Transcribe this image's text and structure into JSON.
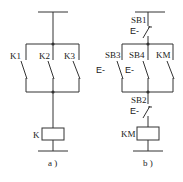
{
  "diagram_a": {
    "caption": "a )",
    "contacts": [
      {
        "label": "K1",
        "type": "normally-open"
      },
      {
        "label": "K2",
        "type": "normally-open"
      },
      {
        "label": "K3",
        "type": "normally-open"
      }
    ],
    "coil": {
      "label": "K"
    }
  },
  "diagram_b": {
    "caption": "b )",
    "series_top": {
      "label": "SB1",
      "actuator": "E-",
      "type": "normally-closed-pushbutton"
    },
    "contacts": [
      {
        "label": "SB3",
        "actuator": "E-",
        "type": "normally-open-pushbutton"
      },
      {
        "label": "SB4",
        "actuator": "E-",
        "type": "normally-open-pushbutton"
      },
      {
        "label": "KM",
        "actuator": "",
        "type": "normally-open"
      }
    ],
    "series_bottom": {
      "label": "SB2",
      "actuator": "E-",
      "type": "normally-closed-pushbutton"
    },
    "coil": {
      "label": "KM"
    }
  },
  "colors": {
    "line": "#333333",
    "text": "#222222",
    "background": "#ffffff"
  }
}
